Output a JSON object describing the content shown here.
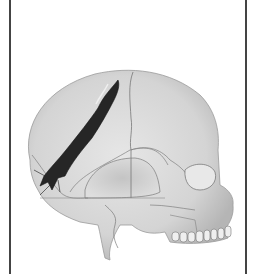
{
  "figure": {
    "colors": {
      "bone": "#d9d9d9",
      "bone_shade": "#bdbdbd",
      "suture_line": "#6e6e6e",
      "fracture": "#262626",
      "frame_border": "#444444",
      "background": "#ffffff"
    }
  }
}
